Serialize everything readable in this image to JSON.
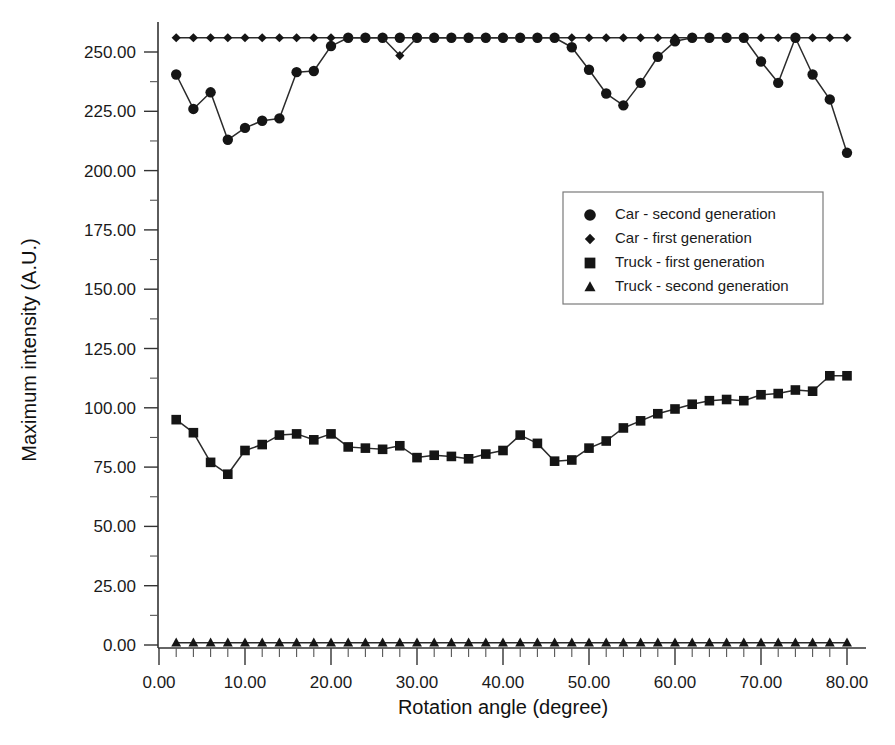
{
  "chart_data": {
    "type": "line",
    "title": "",
    "xlabel": "Rotation angle (degree)",
    "ylabel": "Maximum intensity (A.U.)",
    "xlim": [
      0,
      82
    ],
    "ylim": [
      -8,
      268
    ],
    "grid": false,
    "legend_position": "center-right",
    "x_ticks": [
      "0.00",
      "10.00",
      "20.00",
      "30.00",
      "40.00",
      "50.00",
      "60.00",
      "70.00",
      "80.00"
    ],
    "x_tick_values": [
      0,
      10,
      20,
      30,
      40,
      50,
      60,
      70,
      80
    ],
    "x_minor_step": 2,
    "y_ticks": [
      "0.00",
      "25.00",
      "50.00",
      "75.00",
      "100.00",
      "125.00",
      "150.00",
      "175.00",
      "200.00",
      "225.00",
      "250.00"
    ],
    "y_tick_values": [
      0,
      25,
      50,
      75,
      100,
      125,
      150,
      175,
      200,
      225,
      250
    ],
    "y_minor_step": 12.5,
    "x": [
      2,
      4,
      6,
      8,
      10,
      12,
      14,
      16,
      18,
      20,
      22,
      24,
      26,
      28,
      30,
      32,
      34,
      36,
      38,
      40,
      42,
      44,
      46,
      48,
      50,
      52,
      54,
      56,
      58,
      60,
      62,
      64,
      66,
      68,
      70,
      72,
      74,
      76,
      78,
      80
    ],
    "series": [
      {
        "name": "Car - second generation",
        "marker": "circle",
        "values": [
          240.5,
          226.0,
          233.0,
          213.0,
          218.0,
          221.0,
          222.0,
          241.5,
          242.0,
          252.5,
          256.0,
          256.0,
          256.0,
          256.0,
          256.0,
          256.0,
          256.0,
          256.0,
          256.0,
          256.0,
          256.0,
          256.0,
          256.0,
          252.0,
          242.5,
          232.5,
          227.5,
          237.0,
          248.0,
          254.5,
          256.0,
          256.0,
          256.0,
          256.0,
          246.0,
          237.0,
          256.0,
          240.5,
          230.0,
          207.5
        ]
      },
      {
        "name": "Car - first generation",
        "marker": "diamond",
        "values": [
          256.0,
          256.0,
          256.0,
          256.0,
          256.0,
          256.0,
          256.0,
          256.0,
          256.0,
          256.0,
          256.0,
          256.0,
          256.0,
          248.5,
          256.0,
          256.0,
          256.0,
          256.0,
          256.0,
          256.0,
          256.0,
          256.0,
          256.0,
          256.0,
          256.0,
          256.0,
          256.0,
          256.0,
          256.0,
          256.0,
          256.0,
          256.0,
          256.0,
          256.0,
          256.0,
          256.0,
          256.0,
          256.0,
          256.0,
          256.0
        ]
      },
      {
        "name": "Truck - first generation",
        "marker": "square",
        "values": [
          95.0,
          89.5,
          77.0,
          72.0,
          82.0,
          84.5,
          88.5,
          89.0,
          86.5,
          89.0,
          83.5,
          83.0,
          82.5,
          84.0,
          79.0,
          80.0,
          79.5,
          78.5,
          80.5,
          82.0,
          88.5,
          85.0,
          77.5,
          78.0,
          83.0,
          86.0,
          91.5,
          94.5,
          97.5,
          99.5,
          101.5,
          103.0,
          103.5,
          103.0,
          105.5,
          106.0,
          107.5,
          107.0,
          113.5,
          113.5
        ]
      },
      {
        "name": "Truck - second generation",
        "marker": "triangle",
        "values": [
          1.0,
          1.0,
          1.0,
          1.0,
          1.0,
          1.0,
          1.0,
          1.0,
          1.0,
          1.0,
          1.0,
          1.0,
          1.0,
          1.0,
          1.0,
          1.0,
          1.0,
          1.0,
          1.0,
          1.0,
          1.0,
          1.0,
          1.0,
          1.0,
          1.0,
          1.0,
          1.0,
          1.0,
          1.0,
          1.0,
          1.0,
          1.0,
          1.0,
          1.0,
          1.0,
          1.0,
          1.0,
          1.0,
          1.0,
          1.0
        ]
      }
    ]
  },
  "legend": {
    "entries": [
      {
        "label": "Car - second generation",
        "marker": "circle"
      },
      {
        "label": "Car - first generation",
        "marker": "diamond"
      },
      {
        "label": "Truck - first generation",
        "marker": "square"
      },
      {
        "label": "Truck - second generation",
        "marker": "triangle"
      }
    ]
  },
  "colors": {
    "ink": "#151515",
    "axis": "#333333",
    "background": "#ffffff",
    "legend_border": "#7a7a7a"
  }
}
